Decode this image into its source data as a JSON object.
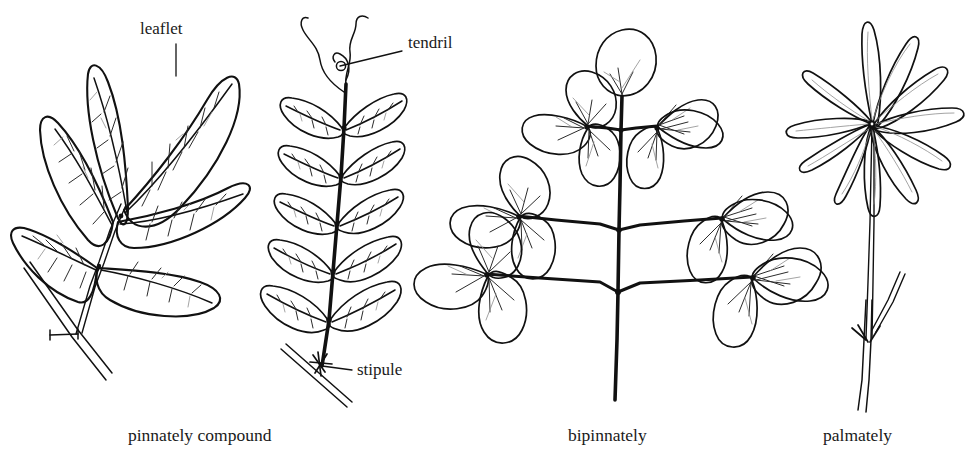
{
  "figure": {
    "background_color": "#ffffff",
    "ink_color": "#111111"
  },
  "annotations": [
    {
      "key": "leaflet",
      "label": "leaflet",
      "target": "upper terminal leaflet of pinnately compound leaf",
      "text_x": 140,
      "text_y": 34,
      "leader": "vertical"
    },
    {
      "key": "tendril",
      "label": "tendril",
      "target": "coiling filament at apex of pinnate rachis",
      "text_x": 408,
      "text_y": 48,
      "leader": "horizontal"
    },
    {
      "key": "stipule",
      "label": "stipule",
      "target": "small appendage at base of petiole",
      "text_x": 357,
      "text_y": 375,
      "leader": "horizontal"
    }
  ],
  "captions": [
    {
      "key": "pinnately-compound",
      "label": "pinnately compound",
      "x": 128,
      "y": 441
    },
    {
      "key": "bipinnately",
      "label": "bipinnately",
      "x": 568,
      "y": 441
    },
    {
      "key": "palmately",
      "label": "palmately",
      "x": 823,
      "y": 441
    }
  ],
  "specimens": [
    {
      "key": "pinnately-compound",
      "name": "Pinnately compound leaf",
      "caption": "pinnately compound",
      "leaflet_count": 5,
      "arrangement": "pinnate, leaflets along a common rachis with a terminal leaflet",
      "parts": [
        "leaflet",
        "rachis",
        "petiole",
        "twig",
        "bud scar"
      ]
    },
    {
      "key": "pinnate-with-tendril",
      "name": "Pinnate leaf with tendril and stipule",
      "caption": "",
      "leaflet_pairs": 5,
      "arrangement": "even-pinnate, five opposite pairs, rachis ending in a tendril",
      "parts": [
        "leaflet",
        "rachis",
        "tendril",
        "stipule",
        "stem"
      ]
    },
    {
      "key": "bipinnately",
      "name": "Bipinnately compound leaf",
      "caption": "bipinnately",
      "branch_levels": 3,
      "leaflets_per_branch": 3,
      "terminal_leaflet": 1,
      "arrangement": "twice-pinnate, lateral branches each bearing rounded leaflets",
      "parts": [
        "leaflet",
        "pinna",
        "rachis",
        "petiole"
      ]
    },
    {
      "key": "palmately",
      "name": "Palmately compound leaf",
      "caption": "palmately",
      "leaflet_count": 11,
      "arrangement": "leaflets radiating from a single point atop a long petiole",
      "parts": [
        "leaflet",
        "petiole",
        "stipule",
        "stem"
      ]
    }
  ]
}
